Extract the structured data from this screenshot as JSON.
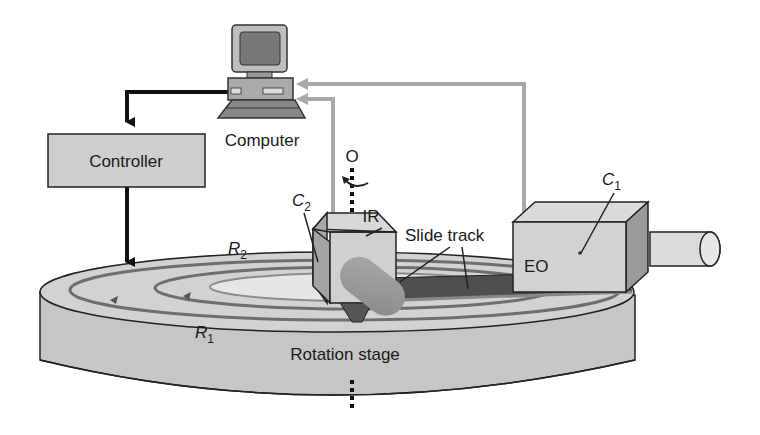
{
  "diagram": {
    "type": "experimental-setup",
    "components": {
      "computer": {
        "label": "Computer"
      },
      "controller": {
        "label": "Controller"
      },
      "axis": {
        "label": "O"
      },
      "ir_camera": {
        "label": "IR",
        "callout": "C",
        "callout_sub": "2"
      },
      "eo_camera": {
        "label": "EO",
        "callout": "C",
        "callout_sub": "1"
      },
      "slide_track": {
        "label": "Slide track"
      },
      "rotation_stage": {
        "label": "Rotation stage"
      },
      "radius_outer": {
        "label": "R",
        "sub": "2"
      },
      "radius_inner": {
        "label": "R",
        "sub": "1"
      }
    },
    "connections": [
      {
        "from": "computer",
        "to": "controller",
        "style": "black-arrow"
      },
      {
        "from": "controller",
        "to": "rotation_stage",
        "style": "black-arrow"
      },
      {
        "from": "ir_camera",
        "to": "computer",
        "style": "gray-arrow"
      },
      {
        "from": "eo_camera",
        "to": "computer",
        "style": "gray-arrow"
      }
    ],
    "colors": {
      "box_fill": "#cfcfcf",
      "stage_fill": "#c8c8c8",
      "signal_line": "#a9a9a9",
      "control_line": "#111111",
      "track_dark": "#555555"
    }
  }
}
